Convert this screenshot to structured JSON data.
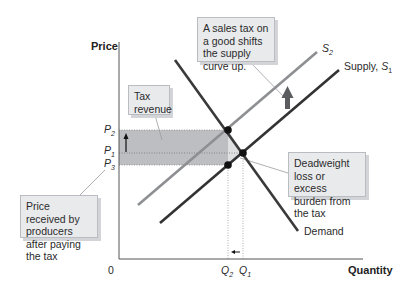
{
  "axes": {
    "y_title": "Price",
    "x_title": "Quantity",
    "origin": "0"
  },
  "price_labels": {
    "p2": "P",
    "p2_sub": "2",
    "p1": "P",
    "p1_sub": "1",
    "p3": "P",
    "p3_sub": "3"
  },
  "quantity_labels": {
    "q2": "Q",
    "q2_sub": "2",
    "q1": "Q",
    "q1_sub": "1"
  },
  "curves": {
    "s2_label": "S",
    "s2_sub": "2",
    "s1_label": "Supply, ",
    "s1_italic": "S",
    "s1_sub": "1",
    "demand_label": "Demand"
  },
  "callouts": {
    "sales_tax": "A sales tax on a good shifts the supply curve up.",
    "tax_revenue": "Tax revenue",
    "deadweight": "Deadweight loss or excess burden from the tax",
    "price_received": "Price received by producers after paying the tax"
  },
  "colors": {
    "demand": "#3a3a3a",
    "supply_s1": "#333333",
    "supply_s2": "#8d8f92",
    "tax_area": "#b8babd",
    "shift_arrow": "#5a5c60"
  }
}
